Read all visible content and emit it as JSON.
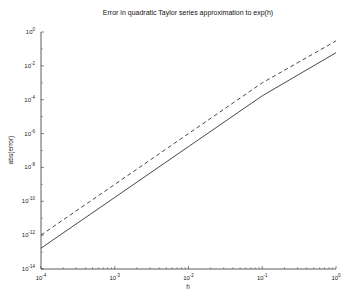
{
  "chart_data": {
    "type": "line",
    "title": "Error in quadratic Taylor series approximation to exp(h)",
    "xlabel": "h",
    "ylabel": "abs(error)",
    "xscale": "log",
    "yscale": "log",
    "xlim": [
      0.0001,
      1
    ],
    "ylim": [
      1e-14,
      1
    ],
    "x_ticks": [
      "10^-4",
      "10^-3",
      "10^-2",
      "10^-1",
      "10^0"
    ],
    "y_ticks": [
      "10^0",
      "10^-2",
      "10^-4",
      "10^-6",
      "10^-8",
      "10^-10",
      "10^-12",
      "10^-14"
    ],
    "grid": false,
    "legend": null,
    "series": [
      {
        "name": "abs(error) (solid)",
        "style": "solid",
        "x": [
          0.0001,
          0.001,
          0.01,
          0.1,
          1
        ],
        "values": [
          1.7e-13,
          1.7e-10,
          1.7e-07,
          0.00017,
          0.06
        ]
      },
      {
        "name": "h^3 reference (dashed)",
        "style": "dashed",
        "x": [
          0.0001,
          0.001,
          0.01,
          0.1,
          1
        ],
        "values": [
          1e-12,
          1e-09,
          1e-06,
          0.001,
          0.3
        ]
      }
    ]
  },
  "labels": {
    "title": "Error in quadratic Taylor series approximation to exp(h)",
    "xlabel": "h",
    "ylabel": "abs(error)",
    "x_ticks": [
      {
        "base": "10",
        "exp": "-4"
      },
      {
        "base": "10",
        "exp": "-3"
      },
      {
        "base": "10",
        "exp": "-2"
      },
      {
        "base": "10",
        "exp": "-1"
      },
      {
        "base": "10",
        "exp": "0"
      }
    ],
    "y_ticks": [
      {
        "base": "10",
        "exp": "0"
      },
      {
        "base": "10",
        "exp": "-2"
      },
      {
        "base": "10",
        "exp": "-4"
      },
      {
        "base": "10",
        "exp": "-6"
      },
      {
        "base": "10",
        "exp": "-8"
      },
      {
        "base": "10",
        "exp": "-10"
      },
      {
        "base": "10",
        "exp": "-12"
      },
      {
        "base": "10",
        "exp": "-14"
      }
    ]
  }
}
